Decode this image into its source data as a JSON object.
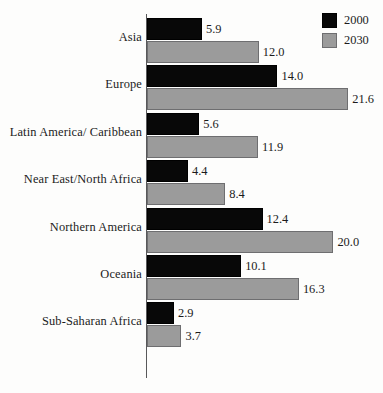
{
  "chart_data": {
    "type": "bar",
    "orientation": "horizontal",
    "title": "",
    "subtitle": "",
    "xlabel": "",
    "ylabel": "",
    "grid": false,
    "legend_position": "top-right",
    "xlim": [
      0,
      21.6
    ],
    "categories": [
      "Asia",
      "Europe",
      "Latin America/ Caribbean",
      "Near East/North Africa",
      "Northern America",
      "Oceania",
      "Sub-Saharan Africa"
    ],
    "series": [
      {
        "name": "2000",
        "color": "#080808",
        "values": [
          5.9,
          14.0,
          5.6,
          4.4,
          12.4,
          10.1,
          2.9
        ],
        "value_labels": [
          "5.9",
          "14.0",
          "5.6",
          "4.4",
          "12.4",
          "10.1",
          "2.9"
        ]
      },
      {
        "name": "2030",
        "color": "#9b9b9b",
        "values": [
          12.0,
          21.6,
          11.9,
          8.4,
          20.0,
          16.3,
          3.7
        ],
        "value_labels": [
          "12.0",
          "21.6",
          "11.9",
          "8.4",
          "20.0",
          "16.3",
          "3.7"
        ]
      }
    ]
  },
  "legend": {
    "entries": [
      {
        "label": "2000",
        "color": "#080808"
      },
      {
        "label": "2030",
        "color": "#9b9b9b"
      }
    ]
  }
}
